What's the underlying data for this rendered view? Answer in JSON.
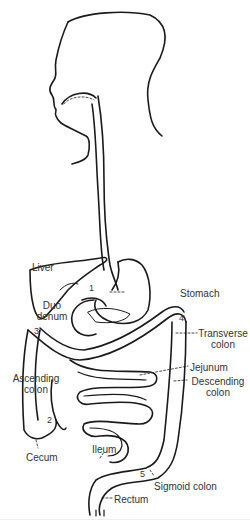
{
  "labels": {
    "liver": "Liver",
    "stomach": "Stomach",
    "duodenum_1": "Duo",
    "duodenum_2": "denum",
    "transverse_1": "Transverse",
    "transverse_2": "colon",
    "jejunum": "Jejunum",
    "descending_1": "Descending",
    "descending_2": "colon",
    "ascending_1": "Ascending",
    "ascending_2": "colon",
    "cecum": "Cecum",
    "ileum": "Ileum",
    "sigmoid": "Sigmoid colon",
    "rectum": "Rectum"
  },
  "numbers": {
    "n1": "1",
    "n2": "2",
    "n3": "3",
    "n4": "4",
    "n5": "5"
  },
  "colors": {
    "line": "#1a1a1a",
    "text": "#333333",
    "background": "#ffffff"
  }
}
